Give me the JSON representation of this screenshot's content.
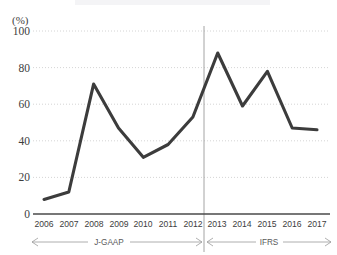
{
  "chart_data": {
    "type": "line",
    "title": "",
    "xlabel": "",
    "ylabel": "(%)",
    "x": [
      "2006",
      "2007",
      "2008",
      "2009",
      "2010",
      "2011",
      "2012",
      "2013",
      "2014",
      "2015",
      "2016",
      "2017"
    ],
    "values": [
      8,
      12,
      71,
      47,
      31,
      38,
      53,
      88,
      59,
      78,
      47,
      46
    ],
    "series": [
      {
        "name": "",
        "values": [
          8,
          12,
          71,
          47,
          31,
          38,
          53,
          88,
          59,
          78,
          47,
          46
        ]
      }
    ],
    "ylim": [
      0,
      100
    ],
    "yticks": [
      0,
      20,
      40,
      60,
      80,
      100
    ],
    "ytick_labels": [
      "0",
      "20",
      "40",
      "60",
      "80",
      "100"
    ],
    "grid": true,
    "legend_position": "none",
    "line_color": "#3c3c3c",
    "grid_color": "#c9c9c9",
    "axis_color": "#4a4a4a",
    "annotations": [
      {
        "label": "J-GAAP",
        "span_start": "2006",
        "span_end": "2012",
        "style": "double-arrow"
      },
      {
        "label": "IFRS",
        "span_start": "2013",
        "span_end": "2017",
        "style": "double-arrow"
      }
    ],
    "divider": {
      "label": "",
      "between": [
        "2012",
        "2013"
      ]
    }
  },
  "axis": {
    "y_unit_label": "(%)",
    "y_ticks": [
      "0",
      "20",
      "40",
      "60",
      "80",
      "100"
    ],
    "x_ticks": [
      "2006",
      "2007",
      "2008",
      "2009",
      "2010",
      "2011",
      "2012",
      "2013",
      "2014",
      "2015",
      "2016",
      "2017"
    ]
  },
  "periods": {
    "left_label": "J-GAAP",
    "right_label": "IFRS"
  }
}
